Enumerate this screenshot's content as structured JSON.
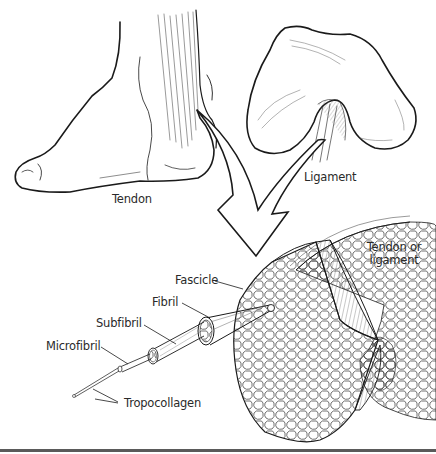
{
  "diagram": {
    "type": "anatomical-illustration",
    "labels": {
      "tendon": "Tendon",
      "ligament": "Ligament",
      "tendon_or_ligament_line1": "Tendon or",
      "tendon_or_ligament_line2": "ligament",
      "fascicle": "Fascicle",
      "fibril": "Fibril",
      "subfibril": "Subfibril",
      "microfibril": "Microfibril",
      "tropocollagen": "Tropocollagen"
    },
    "hierarchy": [
      "Tendon or ligament",
      "Fascicle",
      "Fibril",
      "Subfibril",
      "Microfibril",
      "Tropocollagen"
    ],
    "colors": {
      "line": "#1a1a1a",
      "hatch": "#555555",
      "text": "#2a2a2a",
      "background": "#ffffff",
      "rule": "#5a5a5a"
    }
  }
}
